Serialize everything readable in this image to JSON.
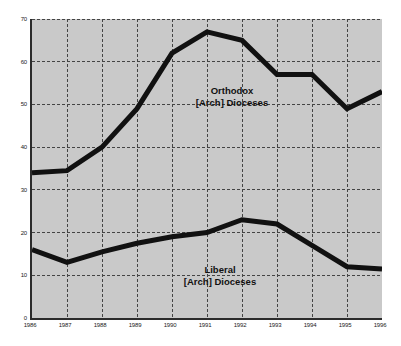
{
  "chart_data": {
    "type": "line",
    "title": "",
    "subtitle": "",
    "xlabel": "",
    "ylabel": "",
    "x": [
      1986,
      1987,
      1988,
      1989,
      1990,
      1991,
      1992,
      1993,
      1994,
      1995,
      1996
    ],
    "x_tick_labels": [
      "1986",
      "1987",
      "1988",
      "1989",
      "1990",
      "1991",
      "1992",
      "1993",
      "1994",
      "1995",
      "1996"
    ],
    "y_tick_labels": [
      "0",
      "10",
      "20",
      "30",
      "40",
      "50",
      "60",
      "70"
    ],
    "y_ticks": [
      0,
      10,
      20,
      30,
      40,
      50,
      60,
      70
    ],
    "xlim": [
      1986,
      1996
    ],
    "ylim": [
      0,
      70
    ],
    "grid": true,
    "grid_style": "dashed",
    "legend_position": "inline-annotation",
    "plot_background_color": "#c9c9c9",
    "page_background_color": "#ffffff",
    "line_color": "#111111",
    "grid_color": "#444444",
    "axis_color": "#2b2b2b",
    "series": [
      {
        "name": "Orthodox [Arch] Dioceses",
        "label_line1": "Orthodox",
        "label_line2": "[Arch] Dioceses",
        "color": "#111111",
        "line_width": 5,
        "values": [
          34,
          34.5,
          40,
          49,
          62,
          67,
          65,
          57,
          57,
          49,
          53
        ]
      },
      {
        "name": "Liberal [Arch] Dioceses",
        "label_line1": "Liberal",
        "label_line2": "[Arch] Dioceses",
        "color": "#111111",
        "line_width": 5,
        "values": [
          16,
          13,
          15.5,
          17.5,
          19,
          20,
          23,
          22,
          17,
          12,
          11.5
        ]
      }
    ]
  }
}
